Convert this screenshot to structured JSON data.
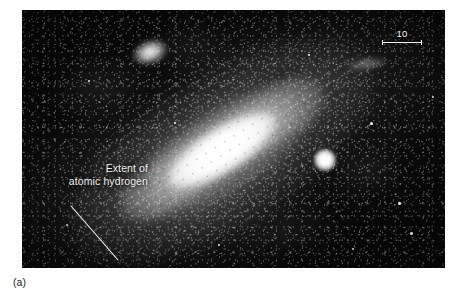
{
  "figure": {
    "caption": "(a)",
    "plate": {
      "background_color": "#080808",
      "alt_description": "Black-and-white photographic plate of a large inclined spiral galaxy with companion galaxies in a dense star field"
    },
    "annotation": {
      "text": "Extent of\natomic hydrogen",
      "line1": "Extent of",
      "line2": "atomic hydrogen",
      "color": "#f2f2f2",
      "leader_line_color": "#f0f0f0"
    },
    "scale_bar": {
      "label": "10",
      "color": "#f0f0f0"
    },
    "objects": [
      {
        "name": "main-galaxy",
        "type": "spiral-galaxy",
        "tilt_degrees": -32
      },
      {
        "name": "companion-upper-left",
        "type": "elliptical-companion"
      },
      {
        "name": "companion-right",
        "type": "elliptical-companion"
      },
      {
        "name": "companion-upper-right",
        "type": "faint-smudge"
      }
    ]
  }
}
